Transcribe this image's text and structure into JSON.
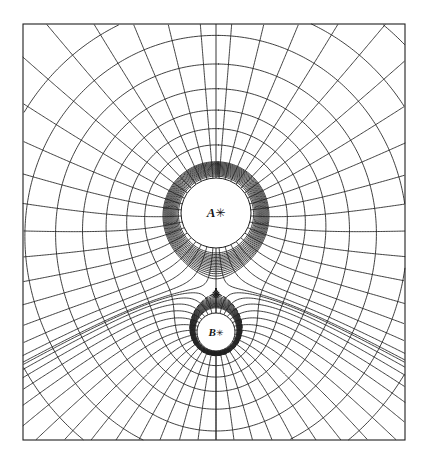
{
  "figure": {
    "background_color": "#ffffff",
    "line_color": "#1f1f1f",
    "frame": {
      "x": 23,
      "y": 24,
      "width": 382,
      "height": 416,
      "stroke_width": 1.1
    }
  },
  "labels": {
    "charge_a": {
      "text": "A",
      "marker": "✳",
      "x": 216,
      "y": 213
    },
    "charge_b": {
      "text": "B",
      "marker": "✳",
      "x": 216,
      "y": 332
    }
  },
  "chart_data": {
    "type": "scatter",
    "xlabel": "",
    "ylabel": "",
    "xlim": [
      23,
      405
    ],
    "ylim": [
      24,
      440
    ],
    "grid": false,
    "legend": false,
    "annotations": [
      {
        "name": "charge-a-label",
        "text": "A✳",
        "x": 216,
        "y": 213
      },
      {
        "name": "charge-b-label",
        "text": "B✳",
        "x": 216,
        "y": 332
      },
      {
        "name": "neutral-point-marker",
        "text": "✳",
        "x": 216,
        "y": 294
      }
    ],
    "charges": [
      {
        "name": "A",
        "x": 216,
        "y": 213,
        "strength": 3.0,
        "disc_radius": 35
      },
      {
        "name": "B",
        "x": 216,
        "y": 332,
        "strength": 1.0,
        "disc_radius": 19
      }
    ],
    "neutral_point": {
      "x": 216,
      "y": 294
    },
    "series": [
      {
        "name": "equipotentials",
        "style": "solid",
        "count": 30,
        "description": "closed loops around each charge, merging into large ovals enclosing both"
      },
      {
        "name": "field-lines",
        "style": "solid",
        "count": 36,
        "description": "radial streamlines orthogonal to equipotentials"
      },
      {
        "name": "separatrix",
        "style": "dashed",
        "count": 1,
        "description": "critical equipotential through the neutral point"
      }
    ]
  }
}
